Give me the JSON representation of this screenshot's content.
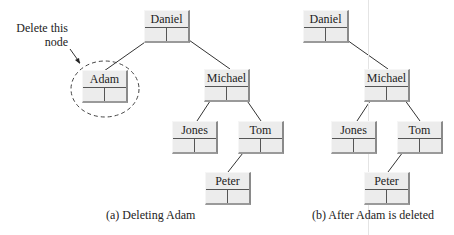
{
  "diagram": {
    "annotation": {
      "line1": "Delete this",
      "line2": "node"
    },
    "panels": [
      {
        "id": "a",
        "caption": "(a) Deleting Adam",
        "nodes": [
          {
            "id": "a-daniel",
            "label": "Daniel"
          },
          {
            "id": "a-adam",
            "label": "Adam",
            "highlighted": true
          },
          {
            "id": "a-michael",
            "label": "Michael"
          },
          {
            "id": "a-jones",
            "label": "Jones"
          },
          {
            "id": "a-tom",
            "label": "Tom"
          },
          {
            "id": "a-peter",
            "label": "Peter"
          }
        ],
        "edges": [
          [
            "Daniel",
            "Adam"
          ],
          [
            "Daniel",
            "Michael"
          ],
          [
            "Michael",
            "Jones"
          ],
          [
            "Michael",
            "Tom"
          ],
          [
            "Tom",
            "Peter"
          ]
        ]
      },
      {
        "id": "b",
        "caption": "(b) After Adam is deleted",
        "nodes": [
          {
            "id": "b-daniel",
            "label": "Daniel"
          },
          {
            "id": "b-michael",
            "label": "Michael"
          },
          {
            "id": "b-jones",
            "label": "Jones"
          },
          {
            "id": "b-tom",
            "label": "Tom"
          },
          {
            "id": "b-peter",
            "label": "Peter"
          }
        ],
        "edges": [
          [
            "Daniel",
            "Michael"
          ],
          [
            "Michael",
            "Jones"
          ],
          [
            "Michael",
            "Tom"
          ],
          [
            "Tom",
            "Peter"
          ]
        ]
      }
    ],
    "colors": {
      "node_fill": "#ececec",
      "node_shadow": "#8a8a8a",
      "line": "#333333"
    }
  }
}
